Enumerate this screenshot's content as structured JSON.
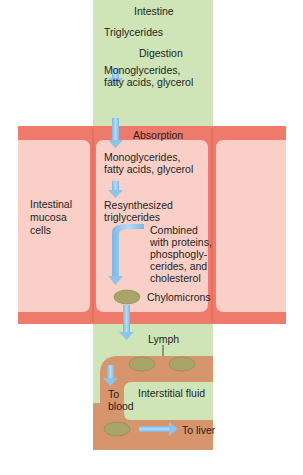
{
  "title": "Intestine",
  "labels": {
    "triglycerides": "Triglycerides",
    "digestion": "Digestion",
    "mono1_line1": "Monoglycerides,",
    "mono1_line2": "fatty acids, glycerol",
    "absorption": "Absorption",
    "mono2_line1": "Monoglycerides,",
    "mono2_line2": "fatty acids, glycerol",
    "resynth_line1": "Resynthesized",
    "resynth_line2": "triglycerides",
    "combined_line1": "Combined",
    "combined_line2": "with proteins,",
    "combined_line3": "phosphogly-",
    "combined_line4": "cerides, and",
    "combined_line5": "cholesterol",
    "chylomicrons": "Chylomicrons",
    "mucosa_line1": "Intestinal",
    "mucosa_line2": "mucosa",
    "mucosa_line3": "cells",
    "lymph": "Lymph",
    "interstitial": "Interstitial fluid",
    "to_blood_line1": "To",
    "to_blood_line2": "blood",
    "to_liver": "To liver"
  },
  "colors": {
    "intestine_green": "#cfe5b8",
    "cell_border_red": "#ee7a6c",
    "cell_fill_pink": "#f9cfc8",
    "vessel_orange": "#d6956c",
    "chylomicron_olive": "#a9a469",
    "arrow_blue": "#8ec3ea"
  }
}
